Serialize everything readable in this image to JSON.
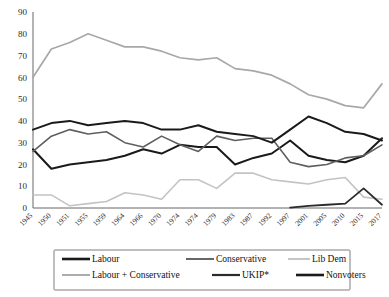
{
  "chart_data": {
    "type": "line",
    "title": "",
    "subtitle": "",
    "xlabel": "",
    "ylabel": "",
    "ylim": [
      0,
      90
    ],
    "yticks": [
      0,
      10,
      20,
      30,
      40,
      50,
      60,
      70,
      80,
      90
    ],
    "grid": false,
    "legend_position": "bottom",
    "categories": [
      "1945",
      "1950",
      "1951",
      "1955",
      "1959",
      "1964",
      "1966",
      "1970",
      "1974",
      "1974",
      "1979",
      "1983",
      "1987",
      "1992",
      "1997",
      "2001",
      "2005",
      "2010",
      "2015",
      "2017"
    ],
    "series": [
      {
        "name": "Labour",
        "color": "#1a1a1a",
        "width": 2.0,
        "values": [
          27,
          18,
          20,
          21,
          22,
          24,
          27,
          25,
          29,
          28,
          28,
          20,
          23,
          25,
          31,
          24,
          22,
          21,
          24,
          32
        ]
      },
      {
        "name": "Conservative",
        "color": "#5f5f5f",
        "width": 1.6,
        "values": [
          26,
          33,
          36,
          34,
          35,
          30,
          28,
          33,
          29,
          26,
          33,
          31,
          32,
          32,
          21,
          19,
          20,
          23,
          24,
          29
        ]
      },
      {
        "name": "Lib Dem",
        "color": "#c3c3c3",
        "width": 1.6,
        "values": [
          6,
          6,
          1,
          2,
          3,
          7,
          6,
          4,
          13,
          13,
          9,
          16,
          16,
          13,
          12,
          11,
          13,
          14,
          5,
          4
        ]
      },
      {
        "name": "Labour + Conservative",
        "color": "#a8a8a8",
        "width": 1.7,
        "values": [
          60,
          73,
          76,
          80,
          77,
          74,
          74,
          72,
          69,
          68,
          69,
          64,
          63,
          61,
          57,
          52,
          50,
          47,
          46,
          57
        ]
      },
      {
        "name": "UKIP*",
        "color": "#2b2b2b",
        "width": 1.8,
        "start_index": 14,
        "values": [
          null,
          null,
          null,
          null,
          null,
          null,
          null,
          null,
          null,
          null,
          null,
          null,
          null,
          null,
          0.2,
          1,
          1.5,
          2,
          9,
          1.5
        ]
      },
      {
        "name": "Nonvoters",
        "color": "#1a1a1a",
        "width": 2.0,
        "values": [
          36,
          39,
          40,
          38,
          39,
          40,
          39,
          36,
          36,
          38,
          35,
          34,
          33,
          30,
          36,
          42,
          39,
          35,
          34,
          31
        ]
      }
    ]
  },
  "legend": {
    "entries": [
      {
        "label": "Labour",
        "color": "#1a1a1a",
        "width": 2.6
      },
      {
        "label": "Conservative",
        "color": "#5f5f5f",
        "width": 1.9
      },
      {
        "label": "Lib Dem",
        "color": "#c3c3c3",
        "width": 1.9
      },
      {
        "label": "Labour + Conservative",
        "color": "#a8a8a8",
        "width": 1.9
      },
      {
        "label": "UKIP*",
        "color": "#2b2b2b",
        "width": 2.2
      },
      {
        "label": "Nonvoters",
        "color": "#1a1a1a",
        "width": 2.6
      }
    ]
  }
}
